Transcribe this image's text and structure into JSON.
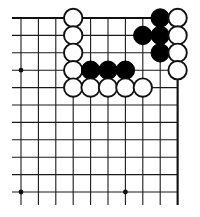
{
  "diagram": {
    "kind": "go-board-corner-diagram",
    "caption_remnant": "",
    "board": {
      "columns": 10,
      "rows": 11,
      "origin_x": 21,
      "origin_y": 18,
      "spacing": 17.4,
      "edges": {
        "top": true,
        "right": true,
        "left": false,
        "bottom": false
      },
      "line_color": "#1a1a1a",
      "edge_color": "#111111",
      "background_color": "#ffffff"
    },
    "star_points": [
      {
        "col": 0,
        "row": 3
      },
      {
        "col": 0,
        "row": 10
      },
      {
        "col": 6,
        "row": 10
      }
    ],
    "stone_radius": 9.2,
    "colors": {
      "black": "#000000",
      "white": "#ffffff",
      "white_outline": "#111111"
    },
    "stones": [
      {
        "col": 3,
        "row": 0,
        "color": "white"
      },
      {
        "col": 8,
        "row": 0,
        "color": "black"
      },
      {
        "col": 9,
        "row": 0,
        "color": "white"
      },
      {
        "col": 3,
        "row": 1,
        "color": "white"
      },
      {
        "col": 7,
        "row": 1,
        "color": "black"
      },
      {
        "col": 8,
        "row": 1,
        "color": "black"
      },
      {
        "col": 9,
        "row": 1,
        "color": "white"
      },
      {
        "col": 3,
        "row": 2,
        "color": "white"
      },
      {
        "col": 8,
        "row": 2,
        "color": "black"
      },
      {
        "col": 9,
        "row": 2,
        "color": "white"
      },
      {
        "col": 3,
        "row": 3,
        "color": "white"
      },
      {
        "col": 4,
        "row": 3,
        "color": "black"
      },
      {
        "col": 5,
        "row": 3,
        "color": "black"
      },
      {
        "col": 6,
        "row": 3,
        "color": "black"
      },
      {
        "col": 9,
        "row": 3,
        "color": "white"
      },
      {
        "col": 3,
        "row": 4,
        "color": "white"
      },
      {
        "col": 4,
        "row": 4,
        "color": "white"
      },
      {
        "col": 5,
        "row": 4,
        "color": "white"
      },
      {
        "col": 6,
        "row": 4,
        "color": "white"
      },
      {
        "col": 7,
        "row": 4,
        "color": "white"
      }
    ]
  }
}
